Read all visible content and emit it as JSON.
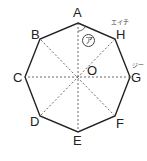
{
  "diagram": {
    "shape": "regular octagon",
    "vertices": [
      {
        "name": "A",
        "x": 78,
        "y": 23
      },
      {
        "name": "H",
        "x": 115,
        "y": 39
      },
      {
        "name": "G",
        "x": 130,
        "y": 77
      },
      {
        "name": "F",
        "x": 115,
        "y": 116
      },
      {
        "name": "E",
        "x": 78,
        "y": 132
      },
      {
        "name": "D",
        "x": 40,
        "y": 116
      },
      {
        "name": "C",
        "x": 25,
        "y": 77
      },
      {
        "name": "B",
        "x": 40,
        "y": 39
      }
    ],
    "center": {
      "name": "O",
      "x": 78,
      "y": 77
    },
    "labels": {
      "A": "A",
      "B": "B",
      "C": "C",
      "D": "D",
      "E": "E",
      "F": "F",
      "G": "G",
      "H": "H",
      "O": "O"
    },
    "ruby": {
      "H": "エイチ",
      "G": "ジー"
    },
    "angle_mark": "ア",
    "line_color": "#222222",
    "diagonal_style": "dashed"
  }
}
